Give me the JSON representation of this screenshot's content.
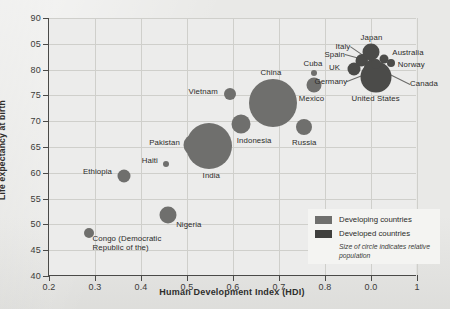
{
  "chart_data": {
    "type": "scatter",
    "title": "",
    "xlabel": "Human Development Index (HDI)",
    "ylabel": "Life expectancy at birth",
    "xlim": [
      0.2,
      1.0
    ],
    "ylim": [
      40,
      90
    ],
    "grid": true,
    "xticks": [
      "0.2",
      "0.3",
      "0.4",
      "0.5",
      "0.6",
      "0.7",
      "0.8",
      "0.0",
      "1"
    ],
    "xtick_values": [
      0.2,
      0.3,
      0.4,
      0.5,
      0.6,
      0.7,
      0.8,
      0.9,
      1.0
    ],
    "yticks": [
      "90",
      "05",
      "80",
      "75",
      "70",
      "65",
      "60",
      "55",
      "50",
      "45",
      "40"
    ],
    "ytick_values": [
      90,
      85,
      80,
      75,
      70,
      65,
      60,
      55,
      50,
      45,
      40
    ],
    "size_encoding": "Size of circle indicates relative population",
    "legend": {
      "position": "bottom-right",
      "entries": [
        {
          "label": "Developing countries",
          "color": "#6f6f6d"
        },
        {
          "label": "Developed countries",
          "color": "#3f3f3d"
        }
      ],
      "note": "Size of circle indicates relative population"
    },
    "points": [
      {
        "name": "Congo (Democratic Republic of the)",
        "hdi": 0.286,
        "life_expectancy": 48.4,
        "group": "developing",
        "r": 5.0,
        "label_dx": 4,
        "label_dy": 10,
        "label_align": "left",
        "two_line": true,
        "leader": false
      },
      {
        "name": "Ethiopia",
        "hdi": 0.363,
        "life_expectancy": 59.3,
        "group": "developing",
        "r": 6.5,
        "label_dx": -12,
        "label_dy": -4,
        "label_align": "right",
        "two_line": false,
        "leader": false
      },
      {
        "name": "Haiti",
        "hdi": 0.454,
        "life_expectancy": 61.7,
        "group": "developing",
        "r": 3.0,
        "label_dx": -8,
        "label_dy": -3,
        "label_align": "right",
        "two_line": false,
        "leader": false
      },
      {
        "name": "Nigeria",
        "hdi": 0.459,
        "life_expectancy": 51.9,
        "group": "developing",
        "r": 8.5,
        "label_dx": 8,
        "label_dy": 10,
        "label_align": "left",
        "two_line": false,
        "leader": false
      },
      {
        "name": "Pakistan",
        "hdi": 0.515,
        "life_expectancy": 65.4,
        "group": "developing",
        "r": 10.5,
        "label_dx": -14,
        "label_dy": -2,
        "label_align": "right",
        "two_line": false,
        "leader": false
      },
      {
        "name": "India",
        "hdi": 0.547,
        "life_expectancy": 65.1,
        "group": "developing",
        "r": 23.0,
        "label_dx": -6,
        "label_dy": 30,
        "label_align": "left",
        "two_line": false,
        "leader": false
      },
      {
        "name": "Vietnam",
        "hdi": 0.593,
        "life_expectancy": 75.2,
        "group": "developing",
        "r": 6.0,
        "label_dx": -12,
        "label_dy": -2,
        "label_align": "right",
        "two_line": false,
        "leader": false
      },
      {
        "name": "Indonesia",
        "hdi": 0.617,
        "life_expectancy": 69.4,
        "group": "developing",
        "r": 9.5,
        "label_dx": -4,
        "label_dy": 17,
        "label_align": "left",
        "two_line": false,
        "leader": false
      },
      {
        "name": "China",
        "hdi": 0.687,
        "life_expectancy": 73.5,
        "group": "developing",
        "r": 24.0,
        "label_dx": -2,
        "label_dy": -30,
        "label_align": "center",
        "two_line": false,
        "leader": false
      },
      {
        "name": "Russia",
        "hdi": 0.755,
        "life_expectancy": 68.8,
        "group": "developing",
        "r": 8.0,
        "label_dx": 0,
        "label_dy": 16,
        "label_align": "center",
        "two_line": false,
        "leader": false
      },
      {
        "name": "Mexico",
        "hdi": 0.775,
        "life_expectancy": 77.1,
        "group": "developing",
        "r": 7.5,
        "label_dx": -2,
        "label_dy": 14,
        "label_align": "center",
        "two_line": false,
        "leader": false
      },
      {
        "name": "Cuba",
        "hdi": 0.776,
        "life_expectancy": 79.3,
        "group": "developing",
        "r": 3.0,
        "label_dx": -1,
        "label_dy": -9,
        "label_align": "center",
        "two_line": false,
        "leader": false
      },
      {
        "name": "UK",
        "hdi": 0.863,
        "life_expectancy": 80.2,
        "group": "developed",
        "r": 6.5,
        "label_dx": -14,
        "label_dy": -1,
        "label_align": "right",
        "two_line": false,
        "leader": false
      },
      {
        "name": "Spain",
        "hdi": 0.878,
        "life_expectancy": 81.6,
        "group": "developed",
        "r": 5.5,
        "label_dx": -16,
        "label_dy": -6,
        "label_align": "right",
        "two_line": false,
        "leader": true
      },
      {
        "name": "Italy",
        "hdi": 0.881,
        "life_expectancy": 81.9,
        "group": "developed",
        "r": 6.0,
        "label_dx": -12,
        "label_dy": -13,
        "label_align": "right",
        "two_line": false,
        "leader": true
      },
      {
        "name": "Germany",
        "hdi": 0.905,
        "life_expectancy": 80.4,
        "group": "developed",
        "r": 9.0,
        "label_dx": -26,
        "label_dy": 14,
        "label_align": "right",
        "two_line": false,
        "leader": true
      },
      {
        "name": "Japan",
        "hdi": 0.901,
        "life_expectancy": 83.4,
        "group": "developed",
        "r": 8.5,
        "label_dx": 0,
        "label_dy": -14,
        "label_align": "center",
        "two_line": false,
        "leader": false
      },
      {
        "name": "United States",
        "hdi": 0.91,
        "life_expectancy": 78.5,
        "group": "developed",
        "r": 15.5,
        "label_dx": 0,
        "label_dy": 22,
        "label_align": "center",
        "two_line": true,
        "leader": false
      },
      {
        "name": "Australia",
        "hdi": 0.929,
        "life_expectancy": 82.0,
        "group": "developed",
        "r": 4.5,
        "label_dx": 8,
        "label_dy": -6,
        "label_align": "left",
        "two_line": false,
        "leader": false
      },
      {
        "name": "Norway",
        "hdi": 0.943,
        "life_expectancy": 81.3,
        "group": "developed",
        "r": 4.0,
        "label_dx": 7,
        "label_dy": 2,
        "label_align": "left",
        "two_line": false,
        "leader": false
      },
      {
        "name": "Canada",
        "hdi": 0.911,
        "life_expectancy": 81.0,
        "group": "developed",
        "r": 5.0,
        "label_dx": 34,
        "label_dy": 20,
        "label_align": "left",
        "two_line": false,
        "leader": true
      }
    ]
  }
}
